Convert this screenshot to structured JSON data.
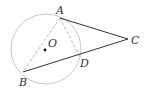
{
  "diagram": {
    "type": "geometry",
    "circle": {
      "center_label": "O",
      "cx": 46,
      "cy": 49,
      "r": 35,
      "color": "#c8c8c8"
    },
    "points": {
      "A": {
        "label": "A",
        "x": 60,
        "y": 18
      },
      "B": {
        "label": "B",
        "x": 23,
        "y": 72
      },
      "C": {
        "label": "C",
        "x": 128,
        "y": 39
      },
      "D": {
        "label": "D",
        "x": 80,
        "y": 57
      },
      "O": {
        "label": "O",
        "x": 45,
        "y": 50
      }
    },
    "segments": [
      {
        "from": "A",
        "to": "C",
        "style": "solid"
      },
      {
        "from": "B",
        "to": "C",
        "style": "solid"
      },
      {
        "from": "A",
        "to": "B",
        "style": "dashed"
      },
      {
        "from": "A",
        "to": "D",
        "style": "dashed"
      }
    ],
    "colors": {
      "solid_line": "#333333",
      "dashed_line": "#b4b4b4",
      "circle": "#c8c8c8",
      "label": "#333333"
    }
  }
}
